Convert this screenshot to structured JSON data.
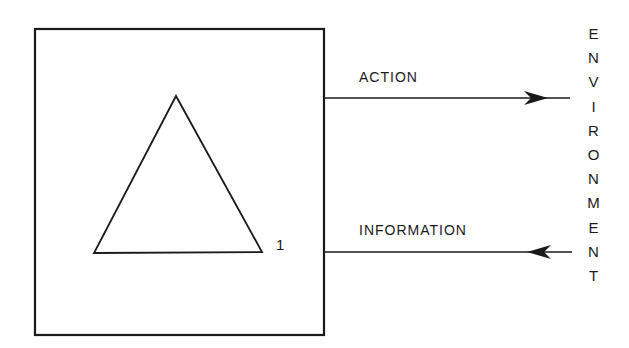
{
  "diagram": {
    "agent_box": {
      "label": ""
    },
    "triangle": {
      "number": "1"
    },
    "action_arrow": {
      "label": "ACTION",
      "direction": "right"
    },
    "information_arrow": {
      "label": "INFORMATION",
      "direction": "left"
    },
    "environment": {
      "label": "ENVIRONMENT",
      "letters": [
        "E",
        "N",
        "V",
        "I",
        "R",
        "O",
        "N",
        "M",
        "E",
        "N",
        "T"
      ]
    },
    "colors": {
      "stroke": "#1a1a1a",
      "background": "#ffffff"
    }
  }
}
